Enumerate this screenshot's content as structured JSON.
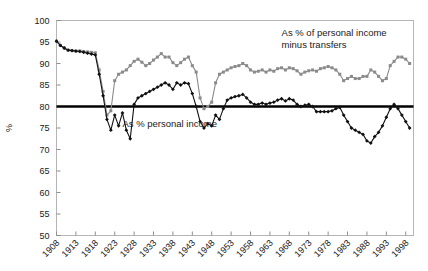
{
  "chart_data": {
    "type": "line",
    "title": "",
    "xlabel": "",
    "ylabel": "%",
    "ylim": [
      50,
      100
    ],
    "ytick_step": 5,
    "yticks": [
      50,
      55,
      60,
      65,
      70,
      75,
      80,
      85,
      90,
      95,
      100
    ],
    "xlim": [
      1908,
      2000
    ],
    "xticks": [
      1908,
      1913,
      1918,
      1923,
      1928,
      1933,
      1938,
      1943,
      1948,
      1953,
      1958,
      1963,
      1968,
      1973,
      1978,
      1983,
      1988,
      1993,
      1998
    ],
    "grid": false,
    "legend_position": "inline-annotation",
    "reference_line": {
      "value": 80,
      "color": "#000000",
      "width": 2.6,
      "label": "80"
    },
    "annotations": [
      {
        "name": "series-label-upper",
        "lines": [
          "As % of personal income",
          "minus transfers"
        ],
        "x": 1966,
        "y": 96.5
      },
      {
        "name": "series-label-lower",
        "lines": [
          "As % personal income"
        ],
        "x": 1925,
        "y": 75.2
      }
    ],
    "series": [
      {
        "name": "As % of personal income minus transfers",
        "color": "#8a8a8a",
        "marker": "square",
        "x": [
          1908,
          1909,
          1910,
          1911,
          1912,
          1913,
          1914,
          1915,
          1916,
          1917,
          1918,
          1919,
          1920,
          1921,
          1922,
          1923,
          1924,
          1925,
          1926,
          1927,
          1928,
          1929,
          1930,
          1931,
          1932,
          1933,
          1934,
          1935,
          1936,
          1937,
          1938,
          1939,
          1940,
          1941,
          1942,
          1943,
          1944,
          1945,
          1946,
          1947,
          1948,
          1949,
          1950,
          1951,
          1952,
          1953,
          1954,
          1955,
          1956,
          1957,
          1958,
          1959,
          1960,
          1961,
          1962,
          1963,
          1964,
          1965,
          1966,
          1967,
          1968,
          1969,
          1970,
          1971,
          1972,
          1973,
          1974,
          1975,
          1976,
          1977,
          1978,
          1979,
          1980,
          1981,
          1982,
          1983,
          1984,
          1985,
          1986,
          1987,
          1988,
          1989,
          1990,
          1991,
          1992,
          1993,
          1994,
          1995,
          1996,
          1997,
          1998,
          1999
        ],
        "values": [
          95.2,
          94.2,
          93.6,
          93.1,
          93.0,
          92.9,
          92.9,
          92.8,
          92.7,
          92.6,
          92.5,
          88.5,
          83.5,
          78.0,
          79.0,
          86.0,
          87.5,
          88.0,
          88.5,
          89.5,
          90.5,
          91.0,
          90.3,
          89.5,
          90.0,
          90.8,
          91.5,
          92.3,
          91.5,
          91.5,
          90.2,
          89.5,
          90.2,
          91.0,
          91.5,
          89.5,
          88.0,
          82.0,
          79.5,
          80.0,
          81.0,
          85.5,
          87.5,
          88.0,
          88.5,
          89.0,
          89.3,
          89.5,
          90.0,
          89.5,
          88.5,
          88.0,
          88.2,
          88.5,
          88.0,
          88.5,
          88.2,
          88.8,
          89.0,
          88.5,
          89.0,
          88.8,
          88.3,
          87.5,
          88.0,
          88.3,
          88.5,
          88.2,
          88.8,
          89.0,
          89.3,
          89.0,
          88.5,
          87.5,
          86.0,
          86.5,
          87.0,
          86.5,
          86.5,
          87.0,
          87.0,
          88.5,
          88.0,
          87.0,
          86.0,
          86.5,
          89.5,
          90.5,
          91.5,
          91.5,
          91.0,
          90.0
        ]
      },
      {
        "name": "As % personal income",
        "color": "#111111",
        "marker": "diamond",
        "x": [
          1908,
          1909,
          1910,
          1911,
          1912,
          1913,
          1914,
          1915,
          1916,
          1917,
          1918,
          1919,
          1920,
          1921,
          1922,
          1923,
          1924,
          1925,
          1926,
          1927,
          1928,
          1929,
          1930,
          1931,
          1932,
          1933,
          1934,
          1935,
          1936,
          1937,
          1938,
          1939,
          1940,
          1941,
          1942,
          1943,
          1944,
          1945,
          1946,
          1947,
          1948,
          1949,
          1950,
          1951,
          1952,
          1953,
          1954,
          1955,
          1956,
          1957,
          1958,
          1959,
          1960,
          1961,
          1962,
          1963,
          1964,
          1965,
          1966,
          1967,
          1968,
          1969,
          1970,
          1971,
          1972,
          1973,
          1974,
          1975,
          1976,
          1977,
          1978,
          1979,
          1980,
          1981,
          1982,
          1983,
          1984,
          1985,
          1986,
          1987,
          1988,
          1989,
          1990,
          1991,
          1992,
          1993,
          1994,
          1995,
          1996,
          1997,
          1998,
          1999
        ],
        "values": [
          95.2,
          94.2,
          93.6,
          93.1,
          93.0,
          92.9,
          92.8,
          92.6,
          92.4,
          92.2,
          92.0,
          87.5,
          82.5,
          77.0,
          74.5,
          78.0,
          75.5,
          78.5,
          74.5,
          72.5,
          80.5,
          82.0,
          82.5,
          83.0,
          83.5,
          84.0,
          84.5,
          85.0,
          85.5,
          85.0,
          84.0,
          85.5,
          85.0,
          85.5,
          85.3,
          83.0,
          80.0,
          76.5,
          75.0,
          76.0,
          75.5,
          78.0,
          77.0,
          79.5,
          81.5,
          82.0,
          82.3,
          82.5,
          82.8,
          82.0,
          81.0,
          80.5,
          80.5,
          80.8,
          80.5,
          80.8,
          81.0,
          81.5,
          81.8,
          81.3,
          81.8,
          81.5,
          80.5,
          80.0,
          80.3,
          80.5,
          80.0,
          78.8,
          78.8,
          78.8,
          78.8,
          79.0,
          79.5,
          79.8,
          78.0,
          76.5,
          75.0,
          74.5,
          74.0,
          73.5,
          72.0,
          71.5,
          73.0,
          74.0,
          75.5,
          77.5,
          79.5,
          80.5,
          79.5,
          78.0,
          76.5,
          75.0
        ]
      }
    ]
  },
  "axis": {
    "y_title": "%"
  }
}
